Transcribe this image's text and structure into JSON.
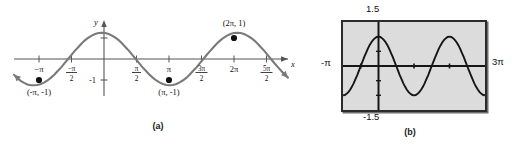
{
  "figure": {
    "panels": [
      {
        "id": "a",
        "caption": "(a)",
        "axis_labels": {
          "x": "x",
          "y": "y"
        },
        "y_tick_label": "-1",
        "x_tick_labels": [
          {
            "text": "-π",
            "type": "plain"
          },
          {
            "text": "-π/2",
            "type": "fraction",
            "num": "-π",
            "den": "2"
          },
          {
            "text": "π/2",
            "type": "fraction",
            "num": "π",
            "den": "2"
          },
          {
            "text": "π",
            "type": "plain"
          },
          {
            "text": "3π/2",
            "type": "fraction",
            "num": "3π",
            "den": "2"
          },
          {
            "text": "2π",
            "type": "plain"
          },
          {
            "text": "5π/2",
            "type": "fraction",
            "num": "5π",
            "den": "2"
          }
        ],
        "point_labels": [
          "(-π, -1)",
          "(π, -1)",
          "(2π, 1)"
        ]
      },
      {
        "id": "b",
        "caption": "(b)",
        "window_labels": {
          "top": "1.5",
          "bottom": "-1.5",
          "left": "-π",
          "right": "3π"
        }
      }
    ]
  },
  "chart_data": [
    {
      "type": "line",
      "id": "panel-a-cosine",
      "title": "",
      "subtitle": "",
      "xlabel": "x",
      "ylabel": "y",
      "function": "y = cos(x)",
      "xlim": [
        -4.08,
        8.64
      ],
      "ylim": [
        -1.6,
        1.6
      ],
      "xlim_label": [
        "-1.3π",
        "2.75π"
      ],
      "grid": false,
      "legend": null,
      "x_ticks": [
        -3.14159,
        -1.5708,
        1.5708,
        3.14159,
        4.71239,
        6.28319,
        7.85398
      ],
      "x_tick_labels": [
        "-π",
        "-π/2",
        "π/2",
        "π",
        "3π/2",
        "2π",
        "5π/2"
      ],
      "y_ticks": [
        -1,
        1
      ],
      "y_tick_labels": [
        "-1",
        ""
      ],
      "annotations": [
        {
          "text": "(-π, -1)",
          "x": -3.14159,
          "y": -1,
          "marker": true
        },
        {
          "text": "(π, -1)",
          "x": 3.14159,
          "y": -1,
          "marker": true
        },
        {
          "text": "(2π, 1)",
          "x": 6.28319,
          "y": 1,
          "marker": true
        }
      ],
      "series": [
        {
          "name": "cos(x)",
          "color": "#7a7a7a",
          "x": [
            -4.08,
            -3.93,
            -3.77,
            -3.61,
            -3.46,
            -3.3,
            -3.14,
            -2.99,
            -2.83,
            -2.67,
            -2.51,
            -2.36,
            -2.2,
            -2.04,
            -1.88,
            -1.73,
            -1.57,
            -1.41,
            -1.26,
            -1.1,
            -0.94,
            -0.79,
            -0.63,
            -0.47,
            -0.31,
            -0.16,
            0.0,
            0.16,
            0.31,
            0.47,
            0.63,
            0.79,
            0.94,
            1.1,
            1.26,
            1.41,
            1.57,
            1.73,
            1.88,
            2.04,
            2.2,
            2.36,
            2.51,
            2.67,
            2.83,
            2.99,
            3.14,
            3.3,
            3.46,
            3.61,
            3.77,
            3.93,
            4.08,
            4.24,
            4.4,
            4.55,
            4.71,
            4.87,
            5.03,
            5.18,
            5.34,
            5.5,
            5.65,
            5.81,
            5.97,
            6.12,
            6.28,
            6.44,
            6.6,
            6.75,
            6.91,
            7.07,
            7.22,
            7.38,
            7.54,
            7.69,
            7.85,
            8.01,
            8.17,
            8.32,
            8.48,
            8.64
          ],
          "y": [
            -0.6,
            -0.72,
            -0.83,
            -0.91,
            -0.97,
            -1.0,
            -1.0,
            -0.99,
            -0.95,
            -0.89,
            -0.81,
            -0.71,
            -0.59,
            -0.45,
            -0.31,
            -0.16,
            0.0,
            0.16,
            0.31,
            0.45,
            0.59,
            0.71,
            0.81,
            0.89,
            0.95,
            0.99,
            1.0,
            0.99,
            0.95,
            0.89,
            0.81,
            0.71,
            0.59,
            0.45,
            0.31,
            0.16,
            0.0,
            -0.16,
            -0.31,
            -0.45,
            -0.59,
            -0.71,
            -0.81,
            -0.89,
            -0.95,
            -0.99,
            -1.0,
            -0.99,
            -0.95,
            -0.89,
            -0.81,
            -0.71,
            -0.59,
            -0.45,
            -0.31,
            -0.16,
            0.0,
            0.16,
            0.31,
            0.45,
            0.59,
            0.71,
            0.81,
            0.89,
            0.95,
            0.99,
            1.0,
            0.99,
            0.95,
            0.89,
            0.81,
            0.71,
            0.59,
            0.45,
            0.31,
            0.16,
            0.0,
            -0.16,
            -0.31,
            -0.45,
            -0.59,
            -0.71
          ]
        }
      ]
    },
    {
      "type": "line",
      "id": "panel-b-cosine",
      "title": "",
      "subtitle": "",
      "xlabel": "",
      "ylabel": "",
      "function": "y = cos(x)",
      "xlim": [
        -3.14159,
        9.42478
      ],
      "ylim": [
        -1.5,
        1.5
      ],
      "xlim_label": [
        "-π",
        "3π"
      ],
      "ylim_label": [
        "-1.5",
        "1.5"
      ],
      "grid": false,
      "legend": null,
      "x_ticks": [
        -1.5708,
        1.5708,
        4.71239,
        7.85398
      ],
      "y_ticks": [
        -1,
        -0.5,
        0.5,
        1
      ],
      "annotations": [],
      "series": [
        {
          "name": "cos(x)",
          "color": "#161616",
          "x": [
            -3.14159,
            -2.98,
            -2.83,
            -2.67,
            -2.51,
            -2.36,
            -2.2,
            -2.04,
            -1.88,
            -1.73,
            -1.57,
            -1.41,
            -1.26,
            -1.1,
            -0.94,
            -0.79,
            -0.63,
            -0.47,
            -0.31,
            -0.16,
            0.0,
            0.16,
            0.31,
            0.47,
            0.63,
            0.79,
            0.94,
            1.1,
            1.26,
            1.41,
            1.57,
            1.73,
            1.88,
            2.04,
            2.2,
            2.36,
            2.51,
            2.67,
            2.83,
            2.99,
            3.14,
            3.3,
            3.46,
            3.61,
            3.77,
            3.93,
            4.08,
            4.24,
            4.4,
            4.55,
            4.71,
            4.87,
            5.03,
            5.18,
            5.34,
            5.5,
            5.65,
            5.81,
            5.97,
            6.12,
            6.28,
            6.44,
            6.6,
            6.75,
            6.91,
            7.07,
            7.22,
            7.38,
            7.54,
            7.69,
            7.85,
            8.01,
            8.17,
            8.32,
            8.48,
            8.64,
            8.8,
            8.95,
            9.11,
            9.27,
            9.42
          ],
          "y": [
            -1.0,
            -0.99,
            -0.95,
            -0.89,
            -0.81,
            -0.71,
            -0.59,
            -0.45,
            -0.31,
            -0.16,
            0.0,
            0.16,
            0.31,
            0.45,
            0.59,
            0.71,
            0.81,
            0.89,
            0.95,
            0.99,
            1.0,
            0.99,
            0.95,
            0.89,
            0.81,
            0.71,
            0.59,
            0.45,
            0.31,
            0.16,
            0.0,
            -0.16,
            -0.31,
            -0.45,
            -0.59,
            -0.71,
            -0.81,
            -0.89,
            -0.95,
            -0.99,
            -1.0,
            -0.99,
            -0.95,
            -0.89,
            -0.81,
            -0.71,
            -0.59,
            -0.45,
            -0.31,
            -0.16,
            0.0,
            0.16,
            0.31,
            0.45,
            0.59,
            0.71,
            0.81,
            0.89,
            0.95,
            0.99,
            1.0,
            0.99,
            0.95,
            0.89,
            0.81,
            0.71,
            0.59,
            0.45,
            0.31,
            0.16,
            0.0,
            -0.16,
            -0.31,
            -0.45,
            -0.59,
            -0.71,
            -0.81,
            -0.89,
            -0.95,
            -0.99,
            -1.0
          ]
        }
      ]
    }
  ]
}
